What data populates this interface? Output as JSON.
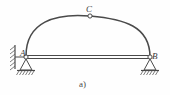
{
  "figure": {
    "caption": "a)",
    "kind": "three-hinged-arch-with-tie",
    "background_color": "#fefefe",
    "line_color": "#4a4a4a",
    "label_color": "#3a3a3a",
    "width": 170,
    "height": 95
  },
  "labels": {
    "apex_hinge": "C",
    "left_support": "A",
    "right_support": "B"
  },
  "geometry": {
    "arch": {
      "left_springing": {
        "x": 26,
        "y": 56
      },
      "right_springing": {
        "x": 150,
        "y": 57
      },
      "apex": {
        "x": 90,
        "y": 16
      },
      "rise": 40,
      "span": 124
    },
    "tie_bar": {
      "start": {
        "x": 26,
        "y": 57
      },
      "end": {
        "x": 150,
        "y": 57
      },
      "thickness": 3
    },
    "hinges": [
      {
        "name": "C",
        "x": 90,
        "y": 16,
        "radius": 2.1
      },
      {
        "name": "A",
        "x": 26,
        "y": 57,
        "radius": 2.1
      },
      {
        "name": "B",
        "x": 150,
        "y": 57,
        "radius": 2.1
      }
    ],
    "left_wall": {
      "x": 15,
      "y_top": 45,
      "y_bottom": 69
    },
    "left_pin_support": {
      "apex_x": 26,
      "apex_y": 59,
      "base_y": 70,
      "half_width": 6
    },
    "right_pin_support": {
      "apex_x": 150,
      "apex_y": 59,
      "base_y": 70,
      "half_width": 6
    },
    "ground_hatch_left": {
      "x": 18,
      "y": 70,
      "width": 17,
      "height": 5
    },
    "ground_hatch_right": {
      "x": 142,
      "y": 70,
      "width": 17,
      "height": 5
    }
  },
  "elements": {
    "arch_rib_name": "arch-rib",
    "tie_bar_name": "tie-bar",
    "wall_name": "fixed-wall-hatching"
  }
}
